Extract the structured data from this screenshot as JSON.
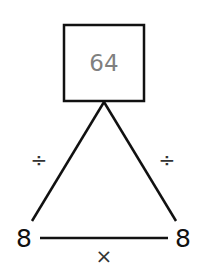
{
  "diagram": {
    "top_value": "64",
    "left_value": "8",
    "right_value": "8",
    "left_edge_operator": "÷",
    "right_edge_operator": "÷",
    "bottom_edge_operator": "×",
    "colors": {
      "line": "#111111",
      "top_value_text": "#808080",
      "numbers": "#111111"
    }
  }
}
